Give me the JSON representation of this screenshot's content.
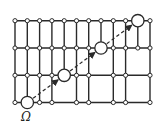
{
  "diagram": {
    "label": "Ω",
    "colors": {
      "line": "#2a2a2a",
      "node_fill": "#ffffff",
      "background": "#ffffff"
    },
    "columns_x": [
      15,
      27.3,
      39.6,
      51.9,
      64.2,
      76.5,
      88.7,
      101,
      113.3,
      125.6,
      137.8,
      150
    ],
    "rows_y": [
      20.7,
      48,
      75.3,
      102.5
    ],
    "bands": [
      {
        "from_row": 0,
        "to_row": 1,
        "vertical_columns": [
          0,
          1,
          2,
          3,
          4,
          5,
          6,
          7,
          8,
          9,
          10,
          11
        ]
      },
      {
        "from_row": 1,
        "to_row": 2,
        "vertical_columns": [
          0,
          1,
          2,
          3,
          4,
          5,
          6,
          8,
          9,
          11
        ]
      },
      {
        "from_row": 2,
        "to_row": 3,
        "vertical_columns": [
          0,
          1,
          2,
          3,
          5,
          6,
          8,
          9,
          11
        ]
      }
    ],
    "highlighted_nodes": [
      {
        "col": 1,
        "row": 3
      },
      {
        "col": 4,
        "row": 2
      },
      {
        "col": 7,
        "row": 1
      },
      {
        "col": 10,
        "row": 0
      }
    ],
    "path_style": "dashed-arrows"
  }
}
